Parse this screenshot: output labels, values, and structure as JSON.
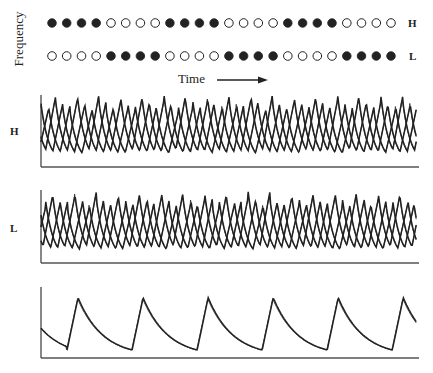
{
  "chart_data": {
    "type": "line",
    "title": "",
    "raster": {
      "ylabel": "Frequency",
      "xlabel": "Time",
      "rows": [
        {
          "label": "H",
          "pattern": [
            1,
            1,
            1,
            1,
            0,
            0,
            0,
            0,
            1,
            1,
            1,
            1,
            0,
            0,
            0,
            0,
            1,
            1,
            1,
            1,
            0,
            0,
            0,
            0
          ]
        },
        {
          "label": "L",
          "pattern": [
            0,
            0,
            0,
            0,
            1,
            1,
            1,
            1,
            0,
            0,
            0,
            0,
            1,
            1,
            1,
            1,
            0,
            0,
            0,
            0,
            1,
            1,
            1,
            1
          ]
        }
      ],
      "legend": "filled circle = active, open circle = inactive"
    },
    "traces": [
      {
        "label": "H",
        "description": "multiple overlapping sawtooth traces (fast spike train)",
        "period_fraction": 0.0577,
        "phases": [
          0.0,
          0.33,
          0.66
        ],
        "peak_levels": [
          0.88,
          0.95,
          0.82
        ]
      },
      {
        "label": "L",
        "description": "multiple overlapping sawtooth traces (fast spike train)",
        "period_fraction": 0.0577,
        "phases": [
          0.1,
          0.45,
          0.78
        ],
        "peak_levels": [
          0.85,
          0.92,
          0.8
        ]
      },
      {
        "label": "",
        "description": "single slow sawtooth trace",
        "period_fraction": 0.173,
        "phases": [
          0.43
        ],
        "peak_levels": [
          0.85
        ],
        "initial_level": 0.42
      }
    ],
    "colors": {
      "ink": "#222222",
      "axis": "#555555"
    }
  }
}
